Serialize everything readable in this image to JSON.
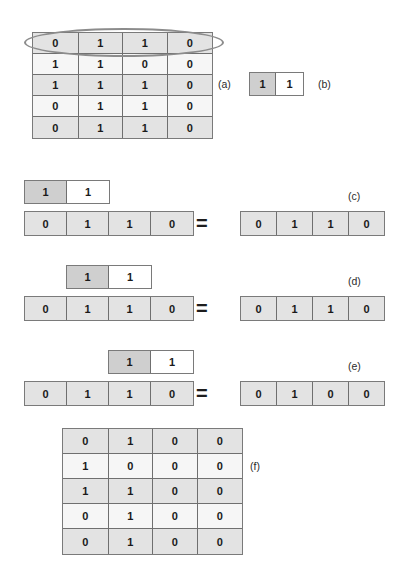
{
  "figure": {
    "background": "#ffffff",
    "shade_gray": "#e3e3e3",
    "shade_light": "#f6f6f6",
    "kernel_gray": "#cfcfcf",
    "border": "#7a7a7a",
    "highlight_color": "#8c8c8c"
  },
  "panels": {
    "a": "(a)",
    "b": "(b)",
    "c": "(c)",
    "d": "(d)",
    "e": "(e)",
    "f": "(f)"
  },
  "operator": {
    "equals": "="
  },
  "matrix_a": {
    "rows": 5,
    "cols": 4,
    "values": [
      [
        "0",
        "1",
        "1",
        "0"
      ],
      [
        "1",
        "1",
        "0",
        "0"
      ],
      [
        "1",
        "1",
        "1",
        "0"
      ],
      [
        "0",
        "1",
        "1",
        "0"
      ],
      [
        "0",
        "1",
        "1",
        "0"
      ]
    ],
    "highlighted_row": 0
  },
  "kernel": {
    "cols": 2,
    "values": [
      "1",
      "1"
    ],
    "anchor_index": 0
  },
  "steps": {
    "c": {
      "input": [
        "0",
        "1",
        "1",
        "0"
      ],
      "kernel": [
        "1",
        "1"
      ],
      "kernel_offset_cells": 0,
      "output": [
        "0",
        "1",
        "1",
        "0"
      ]
    },
    "d": {
      "input": [
        "0",
        "1",
        "1",
        "0"
      ],
      "kernel": [
        "1",
        "1"
      ],
      "kernel_offset_cells": 1,
      "output": [
        "0",
        "1",
        "1",
        "0"
      ]
    },
    "e": {
      "input": [
        "0",
        "1",
        "1",
        "0"
      ],
      "kernel": [
        "1",
        "1"
      ],
      "kernel_offset_cells": 2,
      "output": [
        "0",
        "1",
        "0",
        "0"
      ]
    }
  },
  "matrix_f": {
    "rows": 5,
    "cols": 4,
    "values": [
      [
        "0",
        "1",
        "0",
        "0"
      ],
      [
        "1",
        "0",
        "0",
        "0"
      ],
      [
        "1",
        "1",
        "0",
        "0"
      ],
      [
        "0",
        "1",
        "0",
        "0"
      ],
      [
        "0",
        "1",
        "0",
        "0"
      ]
    ]
  }
}
